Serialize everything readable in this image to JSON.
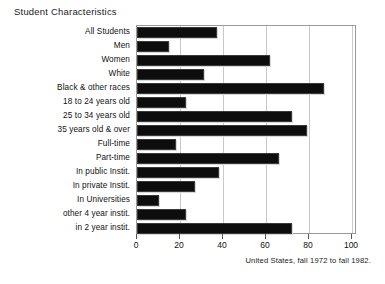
{
  "chart_data": {
    "type": "bar",
    "orientation": "horizontal",
    "title": "Student Characteristics",
    "xlabel": "",
    "ylabel": "",
    "xlim": [
      0,
      100
    ],
    "xticks": [
      0,
      20,
      40,
      60,
      80,
      100
    ],
    "grid": true,
    "legend": "none",
    "annotation": "United States, fall 1972 to fall 1982.",
    "categories": [
      "All Students",
      "Men",
      "Women",
      "White",
      "Black & other races",
      "18 to 24 years old",
      "25 to 34 years old",
      "35 years old & over",
      "Full-time",
      "Part-time",
      "In public Instit.",
      "In private Instit.",
      "In Universities",
      "other 4 year instit.",
      "in 2 year instit."
    ],
    "values": [
      37,
      15,
      62,
      31,
      87,
      23,
      72,
      79,
      18,
      66,
      38,
      27,
      10,
      23,
      72
    ],
    "bar_color": "#0d0d0d"
  },
  "footnote": "United States, fall 1972 to fall 1982."
}
